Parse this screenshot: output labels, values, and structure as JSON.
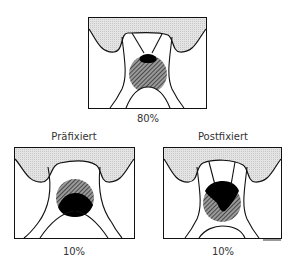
{
  "panels": {
    "top": {
      "percent": "80%",
      "title": ""
    },
    "left": {
      "title": "Präfixiert",
      "percent": "10%"
    },
    "right": {
      "title": "Postfixiert",
      "percent": "10%"
    }
  },
  "colors": {
    "gum": "#dcdcdc",
    "outline": "#111111",
    "hatch": "#555555",
    "dark": "#000000"
  }
}
